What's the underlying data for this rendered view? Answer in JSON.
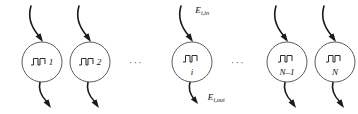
{
  "figure": {
    "type": "neuron-chain-diagram",
    "width": 358,
    "height": 114,
    "background_color": "#ffffff",
    "stroke_color": "#1a1a1a",
    "circle_stroke_color": "#4a4a4a"
  },
  "nodes": [
    {
      "id": "node-1",
      "label": "1",
      "cx": 42,
      "cy": 62,
      "r": 20,
      "label_layout": "inline",
      "glyph": "pulse-train-icon"
    },
    {
      "id": "node-2",
      "label": "2",
      "cx": 90,
      "cy": 62,
      "r": 20,
      "label_layout": "inline",
      "glyph": "pulse-train-icon"
    },
    {
      "id": "node-i",
      "label": "i",
      "cx": 192,
      "cy": 62,
      "r": 20,
      "label_layout": "below",
      "glyph": "pulse-train-icon"
    },
    {
      "id": "node-n-minus-1",
      "label": "N–1",
      "cx": 287,
      "cy": 62,
      "r": 20,
      "label_layout": "below",
      "glyph": "pulse-train-icon"
    },
    {
      "id": "node-n",
      "label": "N",
      "cx": 335,
      "cy": 62,
      "r": 20,
      "label_layout": "below",
      "glyph": "pulse-train-icon"
    }
  ],
  "ellipses": [
    {
      "id": "ellipsis-left",
      "text": "···",
      "cx": 136,
      "cy": 62
    },
    {
      "id": "ellipsis-right",
      "text": "···",
      "cx": 238,
      "cy": 62
    }
  ],
  "energy_labels": [
    {
      "id": "energy-in",
      "symbol": "E",
      "subscript": "i,in",
      "cx": 202,
      "cy": 10
    },
    {
      "id": "energy-out",
      "symbol": "E",
      "subscript": "i,out",
      "cx": 216,
      "cy": 97
    }
  ]
}
